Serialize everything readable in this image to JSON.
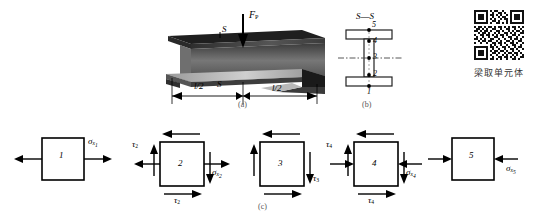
{
  "figure": {
    "panels": [
      {
        "id": "a",
        "label": "(a)",
        "caption_role": "beam-perspective"
      },
      {
        "id": "b",
        "label": "(b)",
        "caption_role": "cross-section"
      },
      {
        "id": "c",
        "label": "(c)",
        "caption_role": "stress-elements"
      }
    ]
  },
  "beam": {
    "load_label": "F",
    "load_sub": "P",
    "section_marker": "S",
    "section_marker_2": "S",
    "dim_left": "l/2",
    "dim_right": "l/2",
    "panel_label": "(a)"
  },
  "cross_section": {
    "title_left": "S",
    "title_dash": "—",
    "title_right": "S",
    "points": [
      "5",
      "4",
      "3",
      "2",
      "1"
    ],
    "panel_label": "(b)"
  },
  "qr": {
    "caption": "梁取单元体"
  },
  "elements_panel": {
    "panel_label": "(c)",
    "elements": [
      {
        "id": "1",
        "number": "1",
        "sigma_symbol": "σ",
        "sigma_sub": "x",
        "sigma_sub_index": "1",
        "tau_symbol": "",
        "tau_sub": "",
        "state": "tension",
        "has_shear": false,
        "has_normal": true
      },
      {
        "id": "2",
        "number": "2",
        "sigma_symbol": "σ",
        "sigma_sub": "x",
        "sigma_sub_index": "2",
        "tau_symbol": "τ",
        "tau_sub": "2",
        "state": "tension-shear",
        "has_shear": true,
        "has_normal": true
      },
      {
        "id": "3",
        "number": "3",
        "sigma_symbol": "",
        "sigma_sub": "",
        "sigma_sub_index": "",
        "tau_symbol": "τ",
        "tau_sub": "3",
        "state": "pure-shear",
        "has_shear": true,
        "has_normal": false
      },
      {
        "id": "4",
        "number": "4",
        "sigma_symbol": "σ",
        "sigma_sub": "x",
        "sigma_sub_index": "4",
        "tau_symbol": "τ",
        "tau_sub": "4",
        "state": "compression-shear",
        "has_shear": true,
        "has_normal": true
      },
      {
        "id": "5",
        "number": "5",
        "sigma_symbol": "σ",
        "sigma_sub": "x",
        "sigma_sub_index": "5",
        "tau_symbol": "",
        "tau_sub": "",
        "state": "compression",
        "has_shear": false,
        "has_normal": true
      }
    ]
  },
  "colors": {
    "ink": "#000000",
    "beam_dark": "#2b2b2b",
    "beam_mid": "#6b6b6b",
    "beam_light": "#c9c9c9",
    "panel_label": "#555555"
  }
}
